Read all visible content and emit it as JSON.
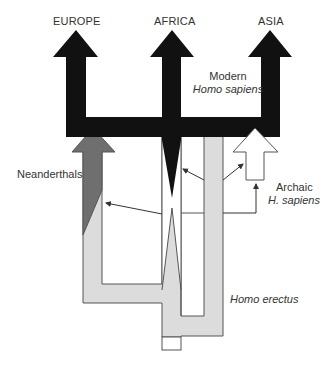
{
  "diagram": {
    "type": "human-evolution-model",
    "regions": [
      {
        "id": "europe",
        "label": "EUROPE"
      },
      {
        "id": "africa",
        "label": "AFRICA"
      },
      {
        "id": "asia",
        "label": "ASIA"
      }
    ],
    "labels": {
      "modern_line1": "Modern",
      "modern_line2": "Homo sapiens",
      "neanderthals": "Neanderthals",
      "archaic_line1": "Archaic",
      "archaic_line2": "H. sapiens",
      "erectus": "Homo erectus"
    },
    "colors": {
      "modern": "#111111",
      "neanderthal": "#6f6f6f",
      "erectus": "#dcdcdc",
      "archaic": "#ffffff",
      "outline": "#555555",
      "text": "#333333"
    }
  }
}
